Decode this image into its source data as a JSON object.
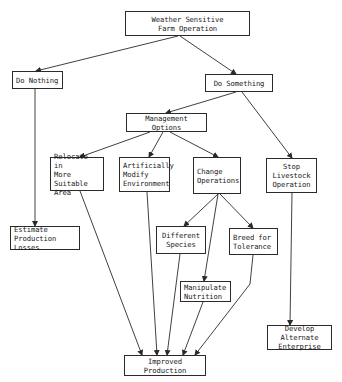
{
  "diagram": {
    "title": "Weather Sensitive Farm Operation",
    "nodes": {
      "root": {
        "label": "Weather Sensitive\nFarm Operation"
      },
      "do_nothing": {
        "label": "Do Nothing"
      },
      "do_something": {
        "label": "Do Something"
      },
      "management_options": {
        "label": "Management Options"
      },
      "relocate": {
        "label": "Relocate in\nMore Suitable\nArea"
      },
      "modify_env": {
        "label": "Artificially\nModify\nEnvironment"
      },
      "change_ops": {
        "label": "Change\nOperations"
      },
      "stop_livestock": {
        "label": "Stop\nLivestock\nOperation"
      },
      "estimate_losses": {
        "label": "Estimate\nProduction Losses"
      },
      "different_species": {
        "label": "Different\nSpecies"
      },
      "breed_tolerance": {
        "label": "Breed for\nTolerance"
      },
      "manipulate_nutrition": {
        "label": "Manipulate\nNutrition"
      },
      "develop_alternate": {
        "label": "Develop Alternate\nEnterprise"
      },
      "improved_production": {
        "label": "Improved Production"
      }
    },
    "edges": [
      [
        "root",
        "do_nothing"
      ],
      [
        "root",
        "do_something"
      ],
      [
        "do_nothing",
        "estimate_losses"
      ],
      [
        "do_something",
        "management_options"
      ],
      [
        "do_something",
        "stop_livestock"
      ],
      [
        "management_options",
        "relocate"
      ],
      [
        "management_options",
        "modify_env"
      ],
      [
        "management_options",
        "change_ops"
      ],
      [
        "change_ops",
        "different_species"
      ],
      [
        "change_ops",
        "manipulate_nutrition"
      ],
      [
        "change_ops",
        "breed_tolerance"
      ],
      [
        "relocate",
        "improved_production"
      ],
      [
        "modify_env",
        "improved_production"
      ],
      [
        "different_species",
        "improved_production"
      ],
      [
        "manipulate_nutrition",
        "improved_production"
      ],
      [
        "breed_tolerance",
        "improved_production"
      ],
      [
        "stop_livestock",
        "develop_alternate"
      ]
    ],
    "colors": {
      "line": "#2a2a2a",
      "background": "#ffffff"
    }
  }
}
